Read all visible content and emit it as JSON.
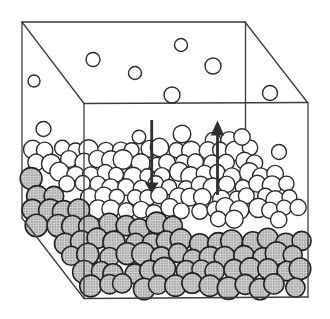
{
  "diagram": {
    "canvas": {
      "width": 330,
      "height": 319,
      "background": "#ffffff"
    },
    "colors": {
      "edge_line": "#3d3d3d",
      "molecule_stroke": "#2c2c2c",
      "bulk_stroke": "#222222",
      "vapor_fill": "#ffffff",
      "stipple_base": "#d2d2d2",
      "stipple_dot": "#8a8a8a",
      "arrow": "#2f2f2f"
    },
    "container_box": {
      "stroke_width": 1.3,
      "back_edges": [
        [
          22,
          22,
          245,
          22
        ],
        [
          22,
          22,
          22,
          218
        ],
        [
          22,
          22,
          84,
          103.5
        ],
        [
          245,
          22,
          307.5,
          102.5
        ],
        [
          84,
          103.5,
          307.5,
          102.5
        ],
        [
          245.5,
          22,
          245.5,
          131
        ]
      ],
      "front_edges": [
        [
          84,
          103.5,
          84,
          298.5
        ],
        [
          22,
          218,
          84,
          298.5
        ],
        [
          84,
          298.5,
          308,
          297
        ],
        [
          308,
          102.5,
          308,
          297
        ]
      ]
    },
    "vapor_molecules": [
      {
        "x": 34,
        "y": 81,
        "r": 6.0
      },
      {
        "x": 93,
        "y": 59.5,
        "r": 7.0
      },
      {
        "x": 135,
        "y": 73,
        "r": 6.5
      },
      {
        "x": 181,
        "y": 45,
        "r": 6.5
      },
      {
        "x": 213,
        "y": 66,
        "r": 8.0
      },
      {
        "x": 172,
        "y": 95,
        "r": 8.0
      },
      {
        "x": 270,
        "y": 93,
        "r": 7.5
      },
      {
        "x": 43.5,
        "y": 129,
        "r": 7.5
      },
      {
        "x": 139,
        "y": 137,
        "r": 6.8
      },
      {
        "x": 182,
        "y": 134,
        "r": 8.8
      },
      {
        "x": 242,
        "y": 137,
        "r": 8.2
      },
      {
        "x": 279,
        "y": 152,
        "r": 7.5
      }
    ],
    "liquid": {
      "surface_layer": {
        "fill": "#ffffff",
        "radius": 8.6,
        "radius_jitter": 1.2,
        "row_start": 138,
        "row_step": 12,
        "col_step": 14.5,
        "jitter": 3.0,
        "seed": 11,
        "region": [
          [
            24,
            146
          ],
          [
            243,
            139
          ],
          [
            303,
            199
          ],
          [
            303,
            221
          ],
          [
            240,
            223
          ],
          [
            95,
            212
          ],
          [
            84,
            202
          ],
          [
            26,
            155
          ]
        ]
      },
      "bulk_layer": {
        "fill": "stipple",
        "radius": 10.4,
        "radius_jitter": 1.0,
        "row_start": 166,
        "row_step": 15,
        "col_step": 17,
        "jitter": 3.2,
        "seed": 29,
        "region": [
          [
            22,
            166
          ],
          [
            84,
            212
          ],
          [
            240,
            230
          ],
          [
            303,
            228
          ],
          [
            303,
            291
          ],
          [
            92,
            292
          ],
          [
            28,
            220
          ]
        ]
      }
    },
    "arrows": {
      "condensation_down": {
        "x": 151.7,
        "shaft_top": 120,
        "shaft_bottom": 184,
        "head_base": 182.5,
        "tip": 193.5,
        "half_width": 6.8,
        "shaft_width": 2.8
      },
      "evaporation_up": {
        "x": 217.5,
        "shaft_top": 134,
        "shaft_bottom": 195,
        "head_base": 135.5,
        "tip": 120.5,
        "half_width": 6.8,
        "shaft_width": 2.8
      }
    }
  }
}
